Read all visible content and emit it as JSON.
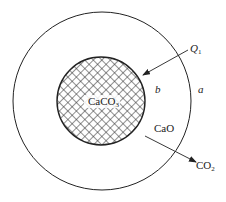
{
  "diagram": {
    "type": "shrinking-core particle cross-section",
    "core_label": "CaCO",
    "core_label_sub": "3",
    "shell_label": "CaO",
    "outer_region_label": "a",
    "interface_region_label": "b",
    "heat_in_label": "Q",
    "heat_in_sub": "1",
    "gas_out_label": "CO",
    "gas_out_sub": "2",
    "colors": {
      "line": "#222222",
      "hatch": "#333333",
      "background": "#ffffff"
    }
  }
}
